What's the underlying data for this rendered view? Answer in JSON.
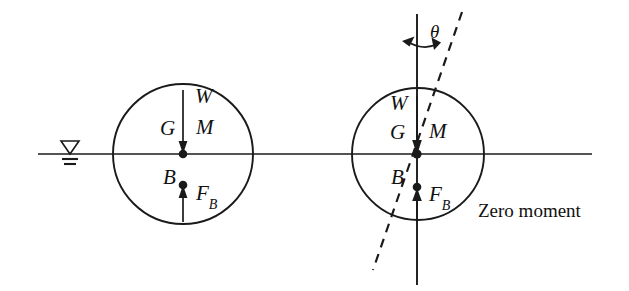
{
  "figure": {
    "stroke_color": "#1a1a1a",
    "background_color": "#ffffff",
    "caption": "Zero moment"
  },
  "waterline": {
    "symbol_name": "water-surface-level-symbol",
    "x": 70,
    "y": 154,
    "line_start_x": 38,
    "line_end_x": 592
  },
  "left_body": {
    "name": "upright-floating-body",
    "center_x": 183,
    "center_y": 154,
    "radius": 70,
    "labels": {
      "weight": "W",
      "center_of_gravity": "G",
      "metacenter": "M",
      "center_of_buoyancy": "B",
      "buoyant_force": "F",
      "buoyant_force_sub": "B"
    },
    "weight_arrow": {
      "direction": "down",
      "from_y": 90,
      "to_y": 154
    },
    "buoyancy_arrow": {
      "direction": "up",
      "from_y": 222,
      "to_y": 185
    }
  },
  "right_body": {
    "name": "heeled-floating-body",
    "center_x": 418,
    "center_y": 154,
    "radius": 66,
    "labels": {
      "weight": "W",
      "center_of_gravity": "G",
      "metacenter": "M",
      "center_of_buoyancy": "B",
      "buoyant_force": "F",
      "buoyant_force_sub": "B",
      "heel_angle": "θ"
    },
    "vertical_axis": {
      "top_y": 14,
      "bottom_y": 285
    },
    "heel_axis": {
      "style": "dashed",
      "top_x": 462,
      "top_y": 12,
      "bottom_x": 373,
      "bottom_y": 270
    },
    "weight_arrow": {
      "direction": "down",
      "from_y": 96,
      "to_y": 154
    },
    "buoyancy_arrow": {
      "direction": "up",
      "from_y": 220,
      "to_y": 190
    },
    "angle_arc": {
      "name": "heel-angle-double-arrow",
      "radius": 40
    }
  }
}
